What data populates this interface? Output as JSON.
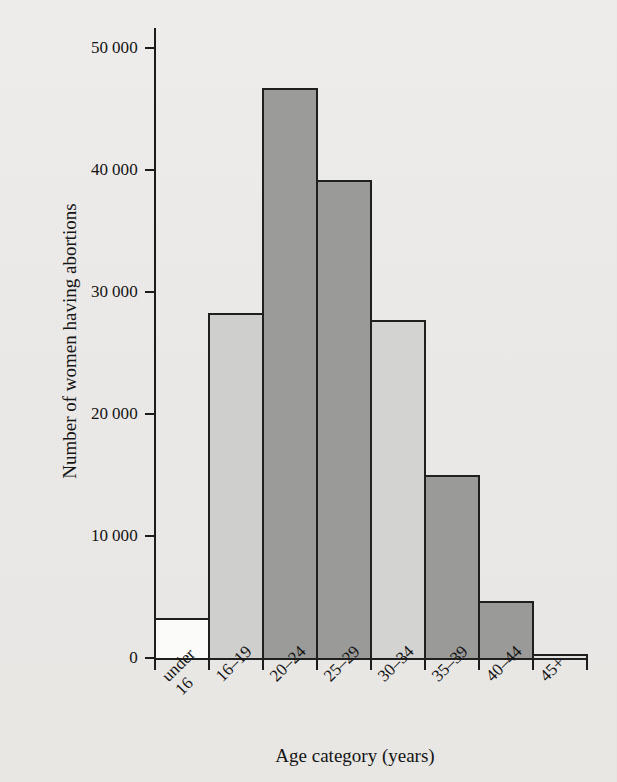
{
  "chart_data": {
    "type": "bar",
    "title": "",
    "xlabel": "Age category (years)",
    "ylabel": "Number of women having abortions",
    "categories": [
      "under 16",
      "16–19",
      "20–24",
      "25–29",
      "30–34",
      "35–39",
      "40–44",
      "45+"
    ],
    "category_labels_display": [
      "under\n16",
      "16–19",
      "20–24",
      "25–29",
      "30–34",
      "35–39",
      "40–44",
      "45+"
    ],
    "values": [
      3300,
      28300,
      46700,
      39200,
      27700,
      15000,
      4700,
      300
    ],
    "bar_colors": [
      "#fbfbfa",
      "#cfcfcd",
      "#9b9b99",
      "#9a9a98",
      "#d3d3d1",
      "#9a9a98",
      "#9a9a98",
      "#e2e2e0"
    ],
    "bar_border_color": "#1f1f1f",
    "ylim": [
      0,
      52000
    ],
    "ytick_values": [
      0,
      10000,
      20000,
      30000,
      40000,
      50000
    ],
    "ytick_labels": [
      "0",
      "10 000",
      "20 000",
      "30 000",
      "40 000",
      "50 000"
    ],
    "grid": false,
    "legend": null,
    "legend_position": "none",
    "xlabel_rotation": -45,
    "background_color": "#edecea"
  }
}
